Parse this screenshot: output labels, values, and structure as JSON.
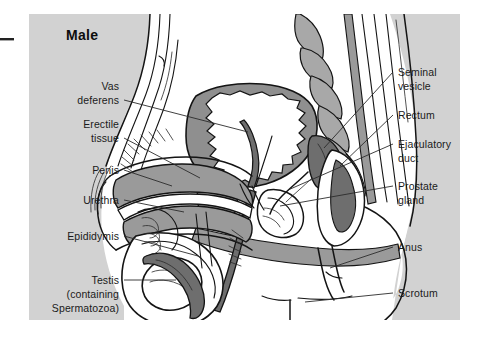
{
  "figure": {
    "title": "Male",
    "panel_bg": "#d2d2d2",
    "page_bg": "#ffffff",
    "ink": "#141414",
    "fill_white": "#ffffff",
    "fill_light_gray": "#c0c0c0",
    "fill_mid_gray": "#9a9a9a",
    "fill_dark_gray": "#6e6e6e",
    "margin_mark": "present"
  },
  "labels": {
    "left": [
      {
        "id": "vas-deferens",
        "line1": "Vas",
        "line2": "deferens"
      },
      {
        "id": "erectile-tissue",
        "line1": "Erectile",
        "line2": "tissue"
      },
      {
        "id": "penis",
        "line1": "Penis",
        "line2": ""
      },
      {
        "id": "urethra",
        "line1": "Urethra",
        "line2": ""
      },
      {
        "id": "epididymis",
        "line1": "Epididymis",
        "line2": ""
      },
      {
        "id": "testis",
        "line1": "Testis",
        "line2": "(containing",
        "line3": "Spermatozoa)"
      }
    ],
    "right": [
      {
        "id": "seminal-vesicle",
        "line1": "Seminal",
        "line2": "vesicle"
      },
      {
        "id": "rectum",
        "line1": "Rectum",
        "line2": ""
      },
      {
        "id": "ejaculatory-duct",
        "line1": "Ejaculatory",
        "line2": "duct"
      },
      {
        "id": "prostate-gland",
        "line1": "Prostate",
        "line2": "gland"
      },
      {
        "id": "anus",
        "line1": "Anus",
        "line2": ""
      },
      {
        "id": "scrotum",
        "line1": "Scrotum",
        "line2": ""
      }
    ]
  }
}
